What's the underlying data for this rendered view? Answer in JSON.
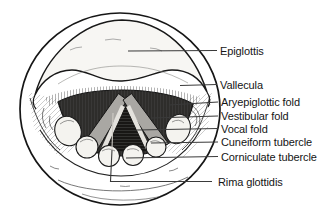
{
  "labels": [
    {
      "id": "epiglottis",
      "text": "Epiglottis"
    },
    {
      "id": "vallecula",
      "text": "Vallecula"
    },
    {
      "id": "aryepiglottic-fold",
      "text": "Aryepiglottic fold"
    },
    {
      "id": "vestibular-fold",
      "text": "Vestibular fold"
    },
    {
      "id": "vocal-fold",
      "text": "Vocal fold"
    },
    {
      "id": "cuneiform-tubercle",
      "text": "Cuneiform tubercle"
    },
    {
      "id": "corniculate-tubercle",
      "text": "Corniculate tubercle"
    },
    {
      "id": "rima-glottidis",
      "text": "Rima glottidis"
    }
  ],
  "colors": {
    "background": "#ffffff",
    "ink": "#1a1a1a",
    "cavity_dark": "#2e2d2b",
    "fold_gray": "#a9a7a3",
    "highlight": "#e4e2dd",
    "leader_line": "#3a3a3a",
    "label_text": "#151515"
  }
}
